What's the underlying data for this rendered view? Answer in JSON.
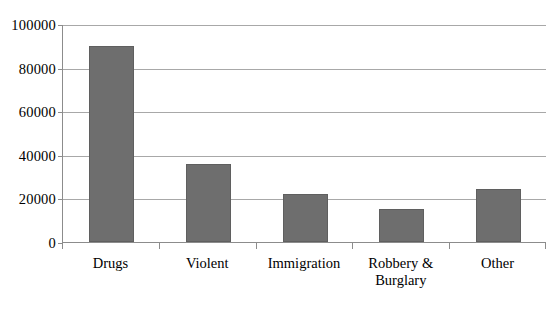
{
  "chart_data": {
    "type": "bar",
    "title": "",
    "subtitle": "",
    "xlabel": "",
    "ylabel": "",
    "categories": [
      "Drugs",
      "Violent",
      "Immigration",
      "Robbery & Burglary",
      "Other"
    ],
    "category_lines": [
      [
        "Drugs"
      ],
      [
        "Violent"
      ],
      [
        "Immigration"
      ],
      [
        "Robbery &",
        "Burglary"
      ],
      [
        "Other"
      ]
    ],
    "values": [
      90000,
      36000,
      22000,
      15000,
      24500
    ],
    "ylim": [
      0,
      100000
    ],
    "ytick_values": [
      0,
      20000,
      40000,
      60000,
      80000,
      100000
    ],
    "ytick_labels": [
      "0",
      "20000",
      "40000",
      "60000",
      "80000",
      "100000"
    ],
    "grid": true,
    "grid_axis": "y",
    "legend": false,
    "legend_position": "none",
    "bar_color": "#6e6e6e",
    "grid_color": "#a8a8a8",
    "axis_color": "#8c8c8c",
    "text_color": "#000000",
    "background_color": "#ffffff"
  }
}
